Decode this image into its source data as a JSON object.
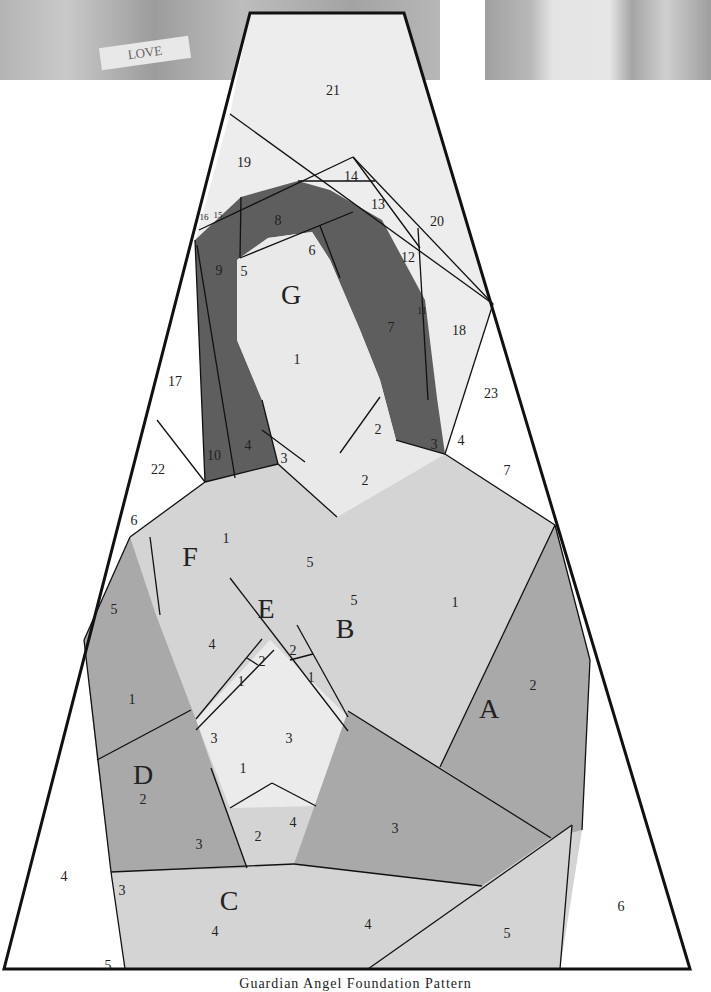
{
  "caption": "Guardian Angel Foundation Pattern",
  "photo_strip": {
    "love_text": "LOVE"
  },
  "colors": {
    "outline": "#111111",
    "white": "#ffffff",
    "light": "#ebebeb",
    "mid_light": "#d4d4d4",
    "mid": "#a8a8a8",
    "dark": "#5e5e5e"
  },
  "section_letters": [
    {
      "id": "G",
      "x": 291,
      "y": 294
    },
    {
      "id": "F",
      "x": 190,
      "y": 556
    },
    {
      "id": "E",
      "x": 266,
      "y": 608
    },
    {
      "id": "B",
      "x": 345,
      "y": 628
    },
    {
      "id": "A",
      "x": 489,
      "y": 708
    },
    {
      "id": "D",
      "x": 143,
      "y": 774
    },
    {
      "id": "C",
      "x": 229,
      "y": 900
    }
  ],
  "piece_numbers": [
    {
      "t": "21",
      "x": 333,
      "y": 90
    },
    {
      "t": "19",
      "x": 244,
      "y": 162
    },
    {
      "t": "14",
      "x": 351,
      "y": 176
    },
    {
      "t": "13",
      "x": 378,
      "y": 204
    },
    {
      "t": "20",
      "x": 437,
      "y": 221
    },
    {
      "t": "16",
      "x": 204,
      "y": 215,
      "s": 9
    },
    {
      "t": "15",
      "x": 218,
      "y": 213,
      "s": 9
    },
    {
      "t": "8",
      "x": 278,
      "y": 220
    },
    {
      "t": "9",
      "x": 219,
      "y": 270
    },
    {
      "t": "5",
      "x": 244,
      "y": 271
    },
    {
      "t": "6",
      "x": 312,
      "y": 250
    },
    {
      "t": "12",
      "x": 408,
      "y": 257
    },
    {
      "t": "11",
      "x": 422,
      "y": 309,
      "s": 10
    },
    {
      "t": "7",
      "x": 391,
      "y": 327
    },
    {
      "t": "18",
      "x": 459,
      "y": 330
    },
    {
      "t": "1",
      "x": 297,
      "y": 359
    },
    {
      "t": "17",
      "x": 175,
      "y": 381
    },
    {
      "t": "23",
      "x": 491,
      "y": 393
    },
    {
      "t": "2",
      "x": 378,
      "y": 429
    },
    {
      "t": "4",
      "x": 461,
      "y": 440
    },
    {
      "t": "3",
      "x": 434,
      "y": 444
    },
    {
      "t": "10",
      "x": 214,
      "y": 455
    },
    {
      "t": "4",
      "x": 248,
      "y": 445
    },
    {
      "t": "3",
      "x": 284,
      "y": 458
    },
    {
      "t": "22",
      "x": 158,
      "y": 469
    },
    {
      "t": "7",
      "x": 507,
      "y": 470
    },
    {
      "t": "2",
      "x": 365,
      "y": 480
    },
    {
      "t": "6",
      "x": 134,
      "y": 520
    },
    {
      "t": "1",
      "x": 226,
      "y": 538
    },
    {
      "t": "5",
      "x": 310,
      "y": 562
    },
    {
      "t": "5",
      "x": 354,
      "y": 600
    },
    {
      "t": "1",
      "x": 455,
      "y": 602
    },
    {
      "t": "5",
      "x": 114,
      "y": 609
    },
    {
      "t": "4",
      "x": 212,
      "y": 644
    },
    {
      "t": "2",
      "x": 293,
      "y": 650
    },
    {
      "t": "2",
      "x": 262,
      "y": 661
    },
    {
      "t": "1",
      "x": 311,
      "y": 677
    },
    {
      "t": "1",
      "x": 241,
      "y": 681
    },
    {
      "t": "2",
      "x": 533,
      "y": 685
    },
    {
      "t": "1",
      "x": 132,
      "y": 699
    },
    {
      "t": "3",
      "x": 214,
      "y": 738
    },
    {
      "t": "3",
      "x": 289,
      "y": 738
    },
    {
      "t": "1",
      "x": 243,
      "y": 768
    },
    {
      "t": "2",
      "x": 143,
      "y": 799
    },
    {
      "t": "4",
      "x": 293,
      "y": 822
    },
    {
      "t": "3",
      "x": 395,
      "y": 828
    },
    {
      "t": "2",
      "x": 258,
      "y": 836
    },
    {
      "t": "3",
      "x": 199,
      "y": 844
    },
    {
      "t": "4",
      "x": 64,
      "y": 876
    },
    {
      "t": "3",
      "x": 122,
      "y": 890
    },
    {
      "t": "6",
      "x": 621,
      "y": 906
    },
    {
      "t": "4",
      "x": 368,
      "y": 924
    },
    {
      "t": "4",
      "x": 215,
      "y": 931
    },
    {
      "t": "5",
      "x": 507,
      "y": 933
    },
    {
      "t": "5",
      "x": 108,
      "y": 965
    }
  ]
}
